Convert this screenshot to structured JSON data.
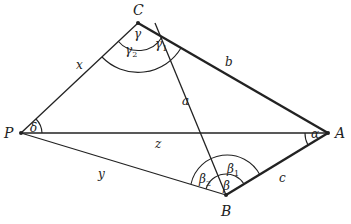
{
  "diagram": {
    "vertices": {
      "C": {
        "label": "C",
        "x": 138,
        "y": 23
      },
      "P": {
        "label": "P",
        "x": 21,
        "y": 133
      },
      "A": {
        "label": "A",
        "x": 328,
        "y": 133
      },
      "B": {
        "label": "B",
        "x": 226,
        "y": 195
      }
    },
    "sides": {
      "x": "x",
      "b": "b",
      "a": "a",
      "z": "z",
      "y": "y",
      "c": "c"
    },
    "angles": {
      "gamma": "γ",
      "gamma1": "γ",
      "gamma1_sub": "1",
      "gamma2": "γ",
      "gamma2_sub": "2",
      "delta": "δ",
      "alpha": "α",
      "beta": "β",
      "beta1": "β",
      "beta1_sub": "1",
      "beta2": "β",
      "beta2_sub": "2"
    },
    "colors": {
      "line": "#222222",
      "background": "#ffffff"
    }
  }
}
